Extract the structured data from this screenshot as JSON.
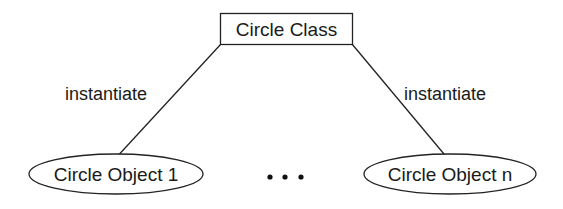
{
  "diagram": {
    "class_box": {
      "label": "Circle Class"
    },
    "edges": [
      {
        "label": "instantiate"
      },
      {
        "label": "instantiate"
      }
    ],
    "objects": [
      {
        "label": "Circle Object 1"
      },
      {
        "label": "Circle Object n"
      }
    ],
    "ellipsis": "• • •",
    "colors": {
      "stroke": "#222222",
      "text": "#1a1a1a",
      "background": "#ffffff"
    }
  }
}
